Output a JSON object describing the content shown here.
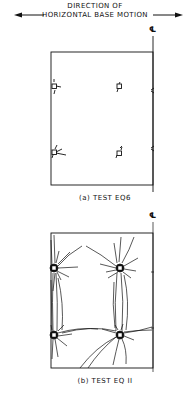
{
  "header": {
    "line1": "DIRECTION OF",
    "line2": "HORIZONTAL BASE MOTION",
    "arrow_left": "left-arrow",
    "arrow_right": "right-arrow"
  },
  "centerline_symbol": "℄",
  "panels": [
    {
      "caption": "(a) TEST EQ6",
      "description": "Wall panel with four openings, minor cracking at openings"
    },
    {
      "caption": "(b) TEST EQ II",
      "description": "Wall panel with four openings, extensive cracking radiating from openings"
    }
  ],
  "colors": {
    "ink": "#111111",
    "background": "#ffffff"
  }
}
